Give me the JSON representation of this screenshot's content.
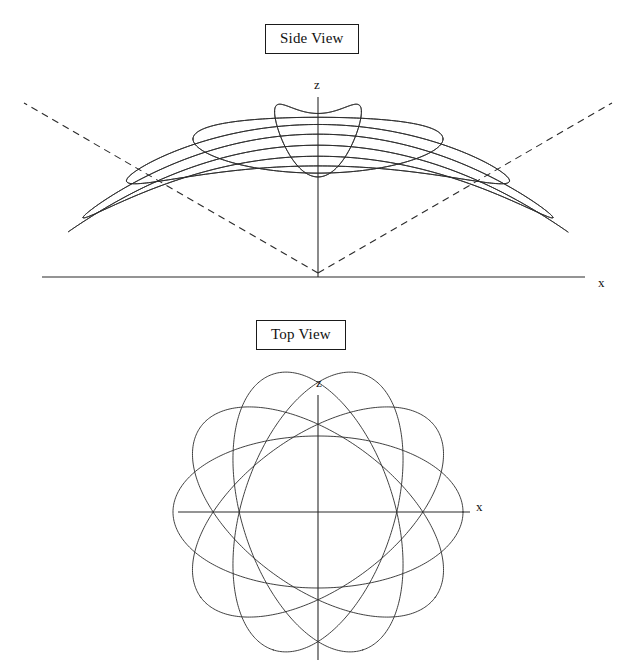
{
  "figure": {
    "title_side": "Side View",
    "title_top": "Top View",
    "width": 631,
    "height": 668,
    "ink_color": "#2b2b2b",
    "background": "#ffffff"
  },
  "panels": [
    {
      "id": "side-view",
      "caption": "Side View",
      "axis_labels": {
        "vertical": "z",
        "horizontal": "x"
      }
    },
    {
      "id": "top-view",
      "caption": "Top View",
      "axis_labels": {
        "vertical": "z",
        "horizontal": "x"
      }
    }
  ],
  "chart_data": {
    "type": "line",
    "series": [
      {
        "name": "orbit-1",
        "precession_angle_deg": 0,
        "view": "both"
      },
      {
        "name": "orbit-2",
        "precession_angle_deg": 36,
        "view": "both"
      },
      {
        "name": "orbit-3",
        "precession_angle_deg": 72,
        "view": "both"
      },
      {
        "name": "orbit-4",
        "precession_angle_deg": 108,
        "view": "both"
      },
      {
        "name": "orbit-5",
        "precession_angle_deg": 144,
        "view": "both"
      }
    ],
    "side_view": {
      "origin_px": [
        318,
        277
      ],
      "x_axis_range_px": [
        42,
        585
      ],
      "z_axis_range_px": [
        97,
        277
      ],
      "orbit_count": 9,
      "semi_major_px": 250,
      "semi_minor_px": 62,
      "apex_px": [
        318,
        273
      ],
      "orbit_floor_px": 232,
      "orbit_ceiling_px": 108,
      "cone_half_angle_deg": 58,
      "cone_dashed": true,
      "cone_left_end_px": [
        24,
        103
      ],
      "cone_right_end_px": [
        612,
        103
      ],
      "inclination_tilt_deg": 0
    },
    "top_view": {
      "origin_px": [
        318,
        512
      ],
      "x_axis_range_px": [
        178,
        470
      ],
      "z_axis_range_px": [
        395,
        660
      ],
      "orbit_count": 5,
      "semi_major_px": 145,
      "semi_minor_px": 76,
      "rotation_step_deg": 36,
      "start_rotation_deg": 0,
      "focus_offset_px": 0
    },
    "xlabel": "x",
    "ylabel": "z",
    "grid": false,
    "legend": false,
    "axis_ranges": {
      "x": [
        -1,
        1
      ],
      "z": [
        -1,
        1
      ]
    }
  }
}
